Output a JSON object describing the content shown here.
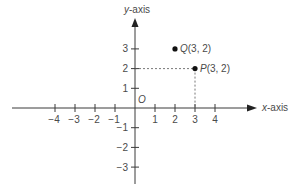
{
  "diagram": {
    "type": "coordinate-plane",
    "axes": {
      "x_label_var": "x",
      "x_label_suffix": "-axis",
      "y_label_var": "y",
      "y_label_suffix": "-axis",
      "origin_label": "O"
    },
    "x_ticks": [
      {
        "value": -4,
        "label": "−4"
      },
      {
        "value": -3,
        "label": "−3"
      },
      {
        "value": -2,
        "label": "−2"
      },
      {
        "value": -1,
        "label": "−1"
      },
      {
        "value": 1,
        "label": "1"
      },
      {
        "value": 2,
        "label": "2"
      },
      {
        "value": 3,
        "label": "3"
      },
      {
        "value": 4,
        "label": "4"
      }
    ],
    "y_ticks": [
      {
        "value": 3,
        "label": "3"
      },
      {
        "value": 2,
        "label": "2"
      },
      {
        "value": 1,
        "label": "1"
      },
      {
        "value": -1,
        "label": "−1"
      },
      {
        "value": -2,
        "label": "−2"
      },
      {
        "value": -3,
        "label": "−3"
      }
    ],
    "points": [
      {
        "name": "Q",
        "coords_text": "(3, 2)",
        "plotted_x": 2,
        "plotted_y": 3,
        "dashed_guides": false
      },
      {
        "name": "P",
        "coords_text": "(3, 2)",
        "plotted_x": 3,
        "plotted_y": 2,
        "dashed_guides": true
      }
    ],
    "colors": {
      "axis": "#3a3a3a",
      "text": "#4a4a4a",
      "point": "#111111",
      "guide": "#555555"
    }
  }
}
